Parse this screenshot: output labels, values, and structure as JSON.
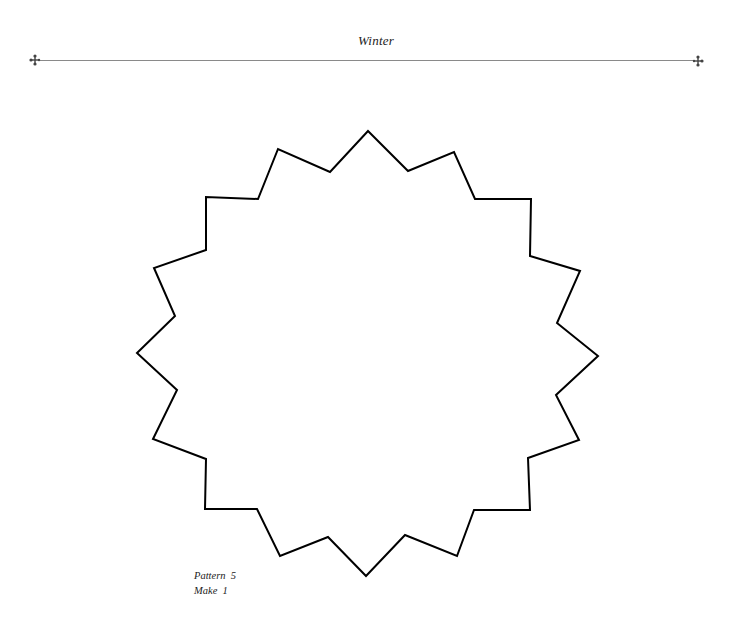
{
  "header": {
    "title": "Winter",
    "ornament_left_icon": "fleuron-icon",
    "ornament_right_icon": "fleuron-icon"
  },
  "pattern": {
    "shape": "sixteen-point-star-outline",
    "stroke_color": "#000000",
    "points": "368,131 408,171 454,152 475,199 531,199 530,256 580,271 557,323 598,356 556,395 579,440 528,458 530,510 474,510 457,556 405,535 366,576 328,537 280,556 257,509 205,509 206,459 153,439 177,390 137,353 175,316 154,268 206,250 206,197 258,199 278,149 330,172"
  },
  "caption": {
    "pattern_label": "Pattern  5",
    "make_label": "Make  1"
  }
}
